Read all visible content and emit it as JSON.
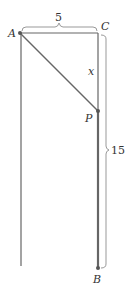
{
  "diagram": {
    "points": {
      "A": {
        "label": "A",
        "x": 20,
        "y": 33
      },
      "C": {
        "label": "C",
        "x": 98,
        "y": 33
      },
      "P": {
        "label": "P",
        "x": 98,
        "y": 111
      },
      "B": {
        "label": "B",
        "x": 98,
        "y": 268
      }
    },
    "labels": {
      "top_dimension": "5",
      "side_dimension": "15",
      "segment_x": "x"
    },
    "colors": {
      "line": "#666666",
      "brace": "#999999",
      "text": "#333333"
    }
  }
}
